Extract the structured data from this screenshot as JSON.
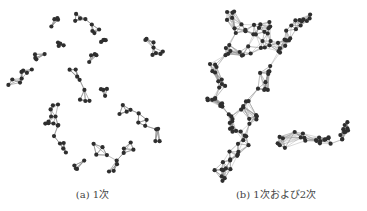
{
  "figure": {
    "subfigures": [
      {
        "id": "a",
        "label": "(a) 1次",
        "description": "first-order network, sparse edges",
        "node_color": "#2e2e2e",
        "edge_color": "#8a8a8a"
      },
      {
        "id": "b",
        "label": "(b) 1次および2次",
        "description": "first- and second-order network, dense edges",
        "node_color": "#2e2e2e",
        "edge_color": "#8f8f8f"
      }
    ]
  }
}
